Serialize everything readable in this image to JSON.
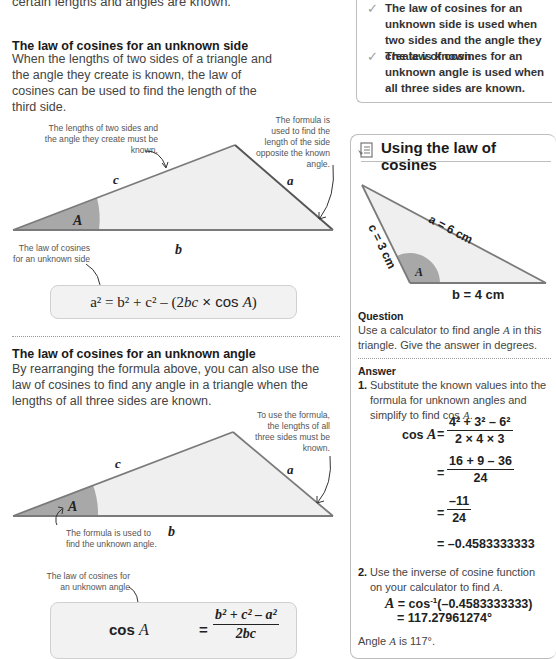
{
  "intro": {
    "text_tail": "certain lengths and angles are known."
  },
  "tip_box": {
    "items": [
      {
        "icon": "check-icon",
        "text": "The law of cosines for an unknown side is used when two sides and the angle they create is known."
      },
      {
        "icon": "check-icon",
        "text": "The law of cosines for an unknown angle is used when all three sides are known."
      }
    ]
  },
  "section_side": {
    "heading": "The law of cosines for an unknown side",
    "body": "When the lengths of two sides of a triangle and the angle they create is known, the law of cosines can be used to find the length of the third side.",
    "annotation_known": "The lengths of two sides and the angle they create must be known.",
    "annotation_opposite": "The formula is used to find the length of the side opposite the known angle.",
    "annotation_formula": "The law of cosines for an unknown side",
    "labels": {
      "a": "a",
      "b": "b",
      "c": "c",
      "A": "A"
    },
    "formula": {
      "lhs": "a² = b² + c² – (2",
      "bc": "bc",
      "times": " × cos ",
      "A": "A",
      "close": ")"
    }
  },
  "section_angle": {
    "heading": "The law of cosines for an unknown angle",
    "body": "By rearranging the formula above, you can also use the law of cosines to find any angle in a triangle when the lengths of all three sides are known.",
    "annotation_sides": "To use the formula, the lengths of all three sides must be known.",
    "annotation_angle": "The formula is used to find the unknown angle.",
    "annotation_formula": "The law of cosines for an unknown angle",
    "labels": {
      "a": "a",
      "b": "b",
      "c": "c",
      "A": "A"
    },
    "formula": {
      "lhs_cos": "cos ",
      "lhs_A": "A",
      "equals": "=",
      "numerator": "b² + c² – a²",
      "denominator": "2bc"
    }
  },
  "example_box": {
    "icon": "worked-example-icon",
    "title": "Using the law of cosines",
    "triangle": {
      "side_a": "a = 6 cm",
      "side_b": "b = 4 cm",
      "side_c": "c = 3 cm",
      "angle": "A"
    },
    "question_heading": "Question",
    "question_text_1": "Use a calculator to find angle ",
    "question_A": "A",
    "question_text_2": " in this triangle. Give the answer in degrees.",
    "answer_heading": "Answer",
    "step1_num": "1.",
    "step1_text": "Substitute the known values into the formula for unknown angles and simplify to find cos ",
    "step1_A": "A",
    "step1_end": ".",
    "calc": {
      "lhs": "cos ",
      "lhs_A": "A",
      "eq": "=",
      "line1_num": "4² + 3² – 6²",
      "line1_den": "2 × 4 × 3",
      "line2_num": "16 + 9 – 36",
      "line2_den": "24",
      "line3_num": "–11",
      "line3_den": "24",
      "line4": "= –0.4583333333"
    },
    "step2_num": "2.",
    "step2_text": "Use the inverse of cosine function on your calculator to find ",
    "step2_A": "A",
    "step2_end": ".",
    "inverse": {
      "A": "A",
      "expr": " = cos",
      "sup": "-1",
      "arg": "(–0.4583333333)",
      "result": "= 117.27961274°"
    },
    "conclusion_1": "Angle ",
    "conclusion_A": "A",
    "conclusion_2": " is 117°."
  },
  "colors": {
    "triangle_fill": "#efefef",
    "triangle_stroke": "#6b6b6b",
    "angle_fill": "#a8a8a8",
    "box_border": "#bdbdbd",
    "formula_bg": "#f2f2f2"
  }
}
